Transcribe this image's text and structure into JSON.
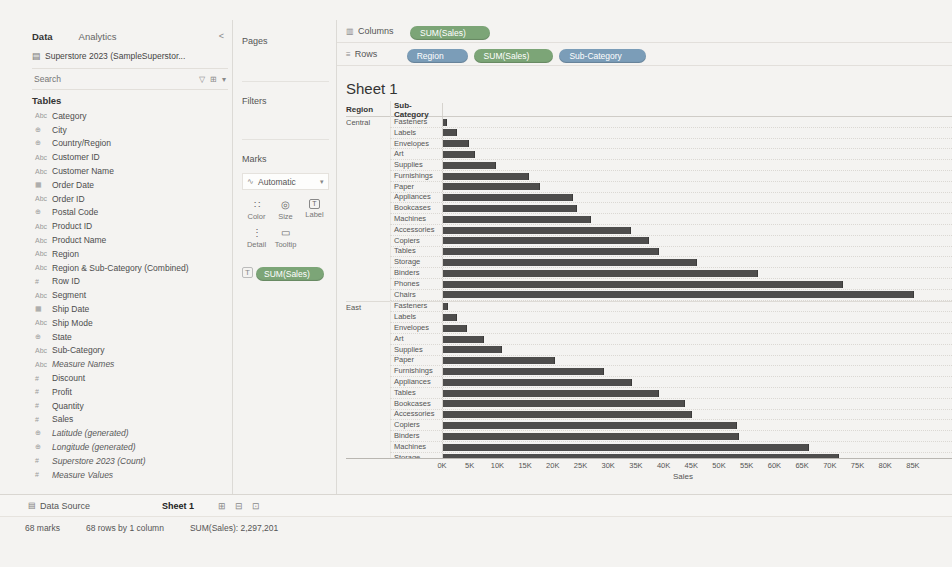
{
  "colors": {
    "dimension_pill": "#7b9db8",
    "measure_pill": "#7ca577",
    "bar": "#4e4d4c"
  },
  "data_pane": {
    "tabs": [
      {
        "label": "Data"
      },
      {
        "label": "Analytics"
      }
    ],
    "collapse_glyph": "<",
    "datasource": "Superstore 2023 (SampleSuperstor...",
    "search_placeholder": "Search",
    "search_icons": [
      {
        "name": "filter-icon",
        "glyph": "▽"
      },
      {
        "name": "view-options-icon",
        "glyph": "⊞"
      },
      {
        "name": "menu-caret-icon",
        "glyph": "▾"
      }
    ],
    "tables_header": "Tables",
    "fields": [
      {
        "icon_name": "text-field-icon",
        "glyph": "Abc",
        "label": "Category",
        "italic": false
      },
      {
        "icon_name": "geo-field-icon",
        "glyph": "⊕",
        "label": "City",
        "italic": false
      },
      {
        "icon_name": "geo-field-icon",
        "glyph": "⊕",
        "label": "Country/Region",
        "italic": false
      },
      {
        "icon_name": "text-field-icon",
        "glyph": "Abc",
        "label": "Customer ID",
        "italic": false
      },
      {
        "icon_name": "text-field-icon",
        "glyph": "Abc",
        "label": "Customer Name",
        "italic": false
      },
      {
        "icon_name": "date-field-icon",
        "glyph": "▦",
        "label": "Order Date",
        "italic": false
      },
      {
        "icon_name": "text-field-icon",
        "glyph": "Abc",
        "label": "Order ID",
        "italic": false
      },
      {
        "icon_name": "geo-field-icon",
        "glyph": "⊕",
        "label": "Postal Code",
        "italic": false
      },
      {
        "icon_name": "text-field-icon",
        "glyph": "Abc",
        "label": "Product ID",
        "italic": false
      },
      {
        "icon_name": "text-field-icon",
        "glyph": "Abc",
        "label": "Product Name",
        "italic": false
      },
      {
        "icon_name": "text-field-icon",
        "glyph": "Abc",
        "label": "Region",
        "italic": false
      },
      {
        "icon_name": "text-field-icon",
        "glyph": "Abc",
        "label": "Region & Sub-Category (Combined)",
        "italic": false
      },
      {
        "icon_name": "number-field-icon",
        "glyph": "#",
        "label": "Row ID",
        "italic": false
      },
      {
        "icon_name": "text-field-icon",
        "glyph": "Abc",
        "label": "Segment",
        "italic": false
      },
      {
        "icon_name": "date-field-icon",
        "glyph": "▦",
        "label": "Ship Date",
        "italic": false
      },
      {
        "icon_name": "text-field-icon",
        "glyph": "Abc",
        "label": "Ship Mode",
        "italic": false
      },
      {
        "icon_name": "geo-field-icon",
        "glyph": "⊕",
        "label": "State",
        "italic": false
      },
      {
        "icon_name": "text-field-icon",
        "glyph": "Abc",
        "label": "Sub-Category",
        "italic": false
      },
      {
        "icon_name": "text-field-icon",
        "glyph": "Abc",
        "label": "Measure Names",
        "italic": true
      },
      {
        "icon_name": "number-field-icon",
        "glyph": "#",
        "label": "Discount",
        "italic": false
      },
      {
        "icon_name": "number-field-icon",
        "glyph": "#",
        "label": "Profit",
        "italic": false
      },
      {
        "icon_name": "number-field-icon",
        "glyph": "#",
        "label": "Quantity",
        "italic": false
      },
      {
        "icon_name": "number-field-icon",
        "glyph": "#",
        "label": "Sales",
        "italic": false
      },
      {
        "icon_name": "geo-field-icon",
        "glyph": "⊕",
        "label": "Latitude (generated)",
        "italic": true
      },
      {
        "icon_name": "geo-field-icon",
        "glyph": "⊕",
        "label": "Longitude (generated)",
        "italic": true
      },
      {
        "icon_name": "number-field-icon",
        "glyph": "#",
        "label": "Superstore 2023 (Count)",
        "italic": true
      },
      {
        "icon_name": "number-field-icon",
        "glyph": "#",
        "label": "Measure Values",
        "italic": true
      }
    ]
  },
  "shelves": {
    "pages_label": "Pages",
    "filters_label": "Filters",
    "marks": {
      "label": "Marks",
      "mark_type": "Automatic",
      "mark_type_caret": "▾",
      "buttons": [
        {
          "name": "color",
          "label": "Color",
          "glyph": "∷",
          "boxed": false
        },
        {
          "name": "size",
          "label": "Size",
          "glyph": "◎",
          "boxed": false
        },
        {
          "name": "label",
          "label": "Label",
          "glyph": "T",
          "boxed": true
        },
        {
          "name": "detail",
          "label": "Detail",
          "glyph": "⋮",
          "boxed": false
        },
        {
          "name": "tooltip",
          "label": "Tooltip",
          "glyph": "▭",
          "boxed": false
        }
      ],
      "pill_role_glyph": "T",
      "pills": [
        {
          "label": "SUM(Sales)",
          "type": "measure"
        }
      ]
    },
    "columns": {
      "label": "Columns",
      "icon_glyph": "▥",
      "pills": [
        {
          "label": "SUM(Sales)",
          "type": "measure"
        }
      ]
    },
    "rows": {
      "label": "Rows",
      "icon_glyph": "≡",
      "pills": [
        {
          "label": "Region",
          "type": "dimension"
        },
        {
          "label": "SUM(Sales)",
          "type": "measure"
        },
        {
          "label": "Sub-Category",
          "type": "dimension"
        }
      ]
    }
  },
  "sheet": {
    "title": "Sheet 1",
    "region_header": "Region",
    "subcategory_header": "Sub-Category"
  },
  "chart_data": {
    "type": "bar",
    "orientation": "horizontal",
    "title": "Sheet 1",
    "xlabel": "Sales",
    "x_max": 87000,
    "x_ticks": [
      {
        "label": "0K",
        "value": 0
      },
      {
        "label": "5K",
        "value": 5000
      },
      {
        "label": "10K",
        "value": 10000
      },
      {
        "label": "15K",
        "value": 15000
      },
      {
        "label": "20K",
        "value": 20000
      },
      {
        "label": "25K",
        "value": 25000
      },
      {
        "label": "30K",
        "value": 30000
      },
      {
        "label": "35K",
        "value": 35000
      },
      {
        "label": "40K",
        "value": 40000
      },
      {
        "label": "45K",
        "value": 45000
      },
      {
        "label": "50K",
        "value": 50000
      },
      {
        "label": "55K",
        "value": 55000
      },
      {
        "label": "60K",
        "value": 60000
      },
      {
        "label": "65K",
        "value": 65000
      },
      {
        "label": "70K",
        "value": 70000
      },
      {
        "label": "75K",
        "value": 75000
      },
      {
        "label": "80K",
        "value": 80000
      },
      {
        "label": "85K",
        "value": 85000
      }
    ],
    "groups": [
      {
        "region": "Central",
        "rows": [
          {
            "label": "Fasteners",
            "value": 780
          },
          {
            "label": "Labels",
            "value": 2490
          },
          {
            "label": "Envelopes",
            "value": 4640
          },
          {
            "label": "Art",
            "value": 5770
          },
          {
            "label": "Supplies",
            "value": 9660
          },
          {
            "label": "Furnishings",
            "value": 15500
          },
          {
            "label": "Paper",
            "value": 17490
          },
          {
            "label": "Appliances",
            "value": 23580
          },
          {
            "label": "Bookcases",
            "value": 24160
          },
          {
            "label": "Machines",
            "value": 26800
          },
          {
            "label": "Accessories",
            "value": 33960
          },
          {
            "label": "Copiers",
            "value": 37260
          },
          {
            "label": "Tables",
            "value": 39150
          },
          {
            "label": "Storage",
            "value": 45930
          },
          {
            "label": "Binders",
            "value": 56920
          },
          {
            "label": "Phones",
            "value": 72400
          },
          {
            "label": "Chairs",
            "value": 85230
          }
        ]
      },
      {
        "region": "East",
        "clipped_last_row": true,
        "rows": [
          {
            "label": "Fasteners",
            "value": 820
          },
          {
            "label": "Labels",
            "value": 2600
          },
          {
            "label": "Envelopes",
            "value": 4380
          },
          {
            "label": "Art",
            "value": 7490
          },
          {
            "label": "Supplies",
            "value": 10760
          },
          {
            "label": "Paper",
            "value": 20170
          },
          {
            "label": "Furnishings",
            "value": 29070
          },
          {
            "label": "Appliances",
            "value": 34190
          },
          {
            "label": "Tables",
            "value": 39140
          },
          {
            "label": "Bookcases",
            "value": 43820
          },
          {
            "label": "Accessories",
            "value": 45030
          },
          {
            "label": "Copiers",
            "value": 53220
          },
          {
            "label": "Binders",
            "value": 53500
          },
          {
            "label": "Machines",
            "value": 66110
          },
          {
            "label": "Storage",
            "value": 71610
          }
        ]
      }
    ]
  },
  "footer": {
    "tabs": [
      {
        "label": "Data Source",
        "icon_glyph": "▤",
        "active": false
      },
      {
        "label": "Sheet 1",
        "active": true
      }
    ],
    "new_sheet_icons": [
      {
        "name": "new-worksheet-icon",
        "glyph": "⊞"
      },
      {
        "name": "new-dashboard-icon",
        "glyph": "⊟"
      },
      {
        "name": "new-story-icon",
        "glyph": "⊡"
      }
    ],
    "status": {
      "marks": "68 marks",
      "size": "68 rows by 1 column",
      "aggregate": "SUM(Sales): 2,297,201"
    }
  }
}
